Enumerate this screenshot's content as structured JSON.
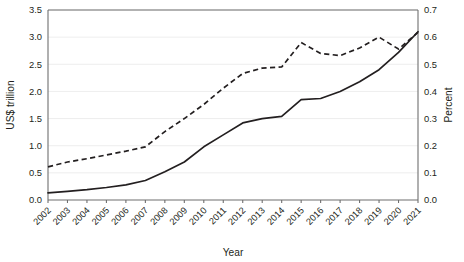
{
  "chart_data": {
    "type": "line",
    "title": "",
    "xlabel": "Year",
    "ylabel": "US$ trillion",
    "y2label": "Percent",
    "grid": true,
    "legend": "none",
    "x": [
      2002,
      2003,
      2004,
      2005,
      2006,
      2007,
      2008,
      2009,
      2010,
      2011,
      2012,
      2013,
      2014,
      2015,
      2016,
      2017,
      2018,
      2019,
      2020,
      2021
    ],
    "categories": [
      "2002",
      "2003",
      "2004",
      "2005",
      "2006",
      "2007",
      "2008",
      "2009",
      "2010",
      "2011",
      "2012",
      "2013",
      "2014",
      "2015",
      "2016",
      "2017",
      "2018",
      "2019",
      "2020",
      "2021"
    ],
    "ylim": [
      0.0,
      3.5
    ],
    "yticks": [
      0.0,
      0.5,
      1.0,
      1.5,
      2.0,
      2.5,
      3.0,
      3.5
    ],
    "ytick_labels": [
      "0.0",
      "0.5",
      "1.0",
      "1.5",
      "2.0",
      "2.5",
      "3.0",
      "3.5"
    ],
    "y2lim": [
      0.0,
      0.7
    ],
    "y2ticks": [
      0.0,
      0.1,
      0.2,
      0.3,
      0.4,
      0.5,
      0.6,
      0.7
    ],
    "y2tick_labels": [
      "0.0",
      "0.1",
      "0.2",
      "0.3",
      "0.4",
      "0.5",
      "0.6",
      "0.7"
    ],
    "xtick_rotation_deg": 45,
    "series": [
      {
        "name": "US$ trillion",
        "axis": "left",
        "style": "solid",
        "color": "#231f20",
        "values": [
          0.13,
          0.16,
          0.19,
          0.23,
          0.28,
          0.36,
          0.52,
          0.7,
          0.98,
          1.2,
          1.42,
          1.5,
          1.54,
          1.85,
          1.87,
          2.0,
          2.18,
          2.4,
          2.72,
          3.1
        ]
      },
      {
        "name": "Percent",
        "axis": "right",
        "style": "dashed",
        "color": "#231f20",
        "values": [
          0.122,
          0.14,
          0.152,
          0.166,
          0.18,
          0.196,
          0.252,
          0.3,
          0.352,
          0.412,
          0.466,
          0.486,
          0.49,
          0.58,
          0.54,
          0.532,
          0.56,
          0.6,
          0.556,
          0.618
        ]
      }
    ]
  },
  "plot_geometry": {
    "left": 48,
    "right": 418,
    "top": 10,
    "bottom": 200
  }
}
